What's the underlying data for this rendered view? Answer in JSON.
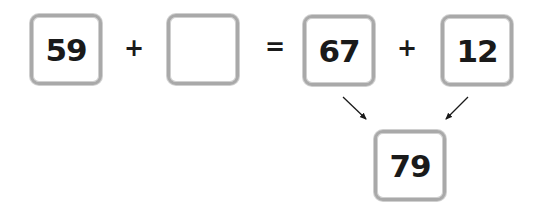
{
  "equation": {
    "left_operand_1": "59",
    "operator_1": "+",
    "left_operand_2": "",
    "equals": "=",
    "right_operand_1": "67",
    "operator_2": "+",
    "right_operand_2": "12",
    "result": "79"
  },
  "colors": {
    "box_border": "#a9a9a9",
    "text": "#1a1a1a"
  },
  "icons": {
    "left_arrow": "arrow-down-right-icon",
    "right_arrow": "arrow-down-left-icon"
  }
}
